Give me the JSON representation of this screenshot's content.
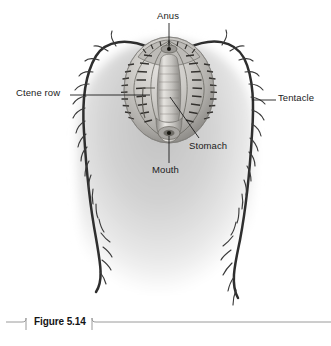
{
  "figure": {
    "caption_label": "Figure 5.14",
    "background_color": "#ffffff",
    "body_tint": "#c9c9c9",
    "ink_color": "#2b2b2b",
    "leader_color": "#1b1b1b",
    "text_color": "#1b1b1b"
  },
  "labels": {
    "anus": "Anus",
    "ctene_row": "Ctene row",
    "tentacle": "Tentacle",
    "stomach": "Stomach",
    "mouth": "Mouth"
  },
  "icons": {
    "organism": "comb-jelly-illustration",
    "tentacle_left": "branching-tentacle-icon",
    "tentacle_right": "branching-tentacle-icon",
    "caption_bracket": "figure-bracket-icon"
  }
}
